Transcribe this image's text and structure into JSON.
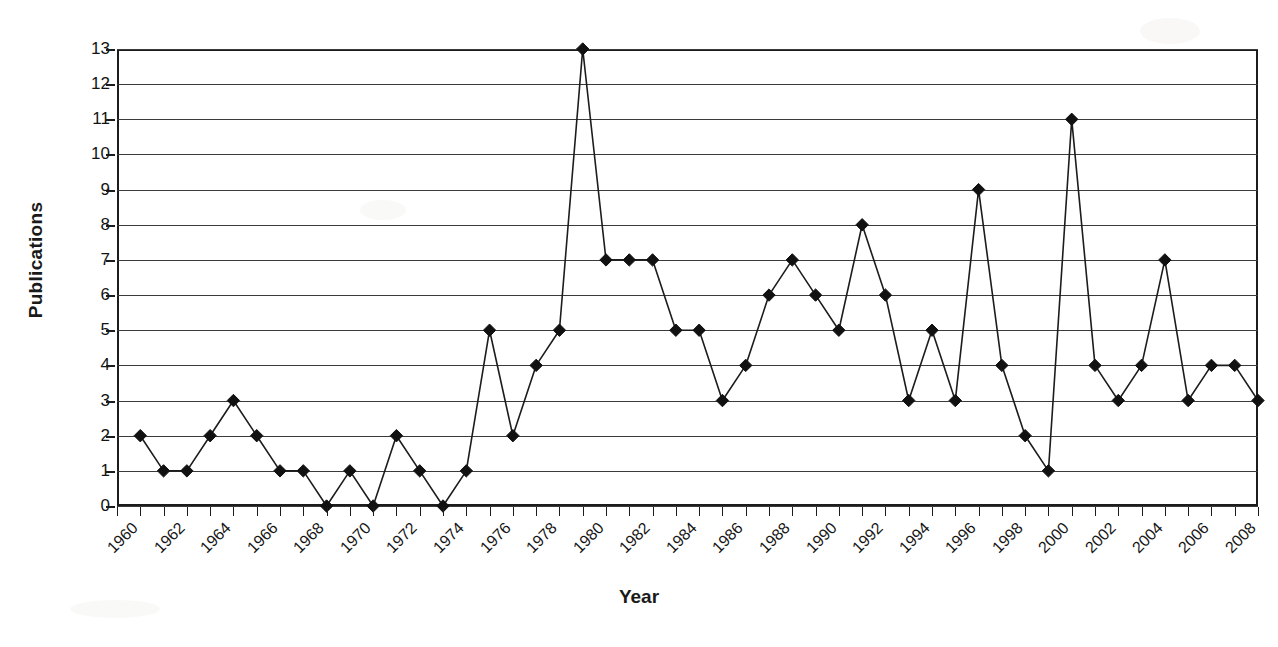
{
  "chart_data": {
    "type": "line",
    "title": "",
    "xlabel": "Year",
    "ylabel": "Publications",
    "ylim": [
      0,
      13
    ],
    "xlim": [
      1960,
      2009
    ],
    "grid": true,
    "legend": false,
    "marker": "diamond",
    "series_color": "#111111",
    "gridline_color": "#3a3a3a",
    "y_ticks": [
      0,
      1,
      2,
      3,
      4,
      5,
      6,
      7,
      8,
      9,
      10,
      11,
      12,
      13
    ],
    "y_tick_labels": [
      "0",
      "1",
      "2",
      "3",
      "4",
      "5",
      "6",
      "7",
      "8",
      "9",
      "10",
      "11",
      "12",
      "13"
    ],
    "x_tick_values": [
      1960,
      1961,
      1962,
      1963,
      1964,
      1965,
      1966,
      1967,
      1968,
      1969,
      1970,
      1971,
      1972,
      1973,
      1974,
      1975,
      1976,
      1977,
      1978,
      1979,
      1980,
      1981,
      1982,
      1983,
      1984,
      1985,
      1986,
      1987,
      1988,
      1989,
      1990,
      1991,
      1992,
      1993,
      1994,
      1995,
      1996,
      1997,
      1998,
      1999,
      2000,
      2001,
      2002,
      2003,
      2004,
      2005,
      2006,
      2007,
      2008,
      2009
    ],
    "x_tick_labels": [
      "1960",
      "",
      "1962",
      "",
      "1964",
      "",
      "1966",
      "",
      "1968",
      "",
      "1970",
      "",
      "1972",
      "",
      "1974",
      "",
      "1976",
      "",
      "1978",
      "",
      "1980",
      "",
      "1982",
      "",
      "1984",
      "",
      "1986",
      "",
      "1988",
      "",
      "1990",
      "",
      "1992",
      "",
      "1994",
      "",
      "1996",
      "",
      "1998",
      "",
      "2000",
      "",
      "2002",
      "",
      "2004",
      "",
      "2006",
      "",
      "2008",
      ""
    ],
    "x": [
      1961,
      1962,
      1963,
      1964,
      1965,
      1966,
      1967,
      1968,
      1969,
      1970,
      1971,
      1972,
      1973,
      1974,
      1975,
      1976,
      1977,
      1978,
      1979,
      1980,
      1981,
      1982,
      1983,
      1984,
      1985,
      1986,
      1987,
      1988,
      1989,
      1990,
      1991,
      1992,
      1993,
      1994,
      1995,
      1996,
      1997,
      1998,
      1999,
      2000,
      2001,
      2002,
      2003,
      2004,
      2005,
      2006,
      2007,
      2008,
      2009
    ],
    "values": [
      2,
      1,
      1,
      2,
      3,
      2,
      1,
      1,
      0,
      1,
      0,
      2,
      1,
      0,
      1,
      5,
      2,
      4,
      5,
      13,
      7,
      7,
      7,
      5,
      5,
      3,
      4,
      6,
      7,
      6,
      5,
      8,
      6,
      3,
      5,
      3,
      9,
      4,
      2,
      1,
      11,
      4,
      3,
      4,
      7,
      3,
      4,
      4,
      3
    ]
  },
  "axes": {
    "y_title": "Publications",
    "x_title": "Year"
  }
}
